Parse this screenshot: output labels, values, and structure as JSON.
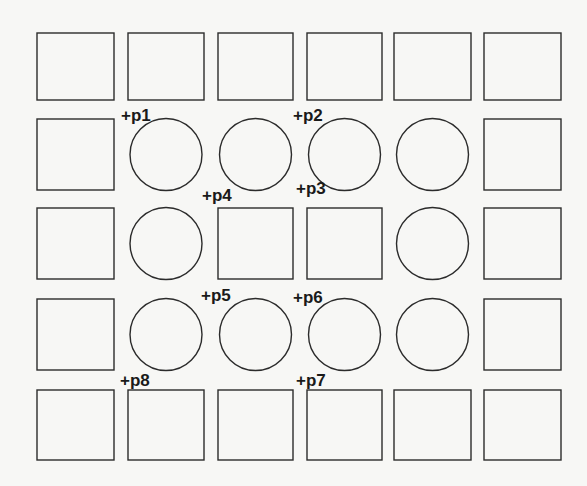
{
  "diagram": {
    "type": "grid-layout",
    "rows": 5,
    "cols": 6,
    "stroke_color": "#2b2b2b",
    "background": "#f7f7f5",
    "col_x": [
      [
        37,
        114
      ],
      [
        128,
        204
      ],
      [
        218,
        293
      ],
      [
        307,
        382
      ],
      [
        394,
        471
      ],
      [
        484,
        561
      ]
    ],
    "row_y": [
      [
        33,
        100
      ],
      [
        119,
        190
      ],
      [
        208,
        279
      ],
      [
        299,
        370
      ],
      [
        390,
        460
      ]
    ],
    "cells": [
      [
        "square",
        "square",
        "square",
        "square",
        "square",
        "square"
      ],
      [
        "square",
        "circle",
        "circle",
        "circle",
        "circle",
        "square"
      ],
      [
        "square",
        "circle",
        "square",
        "square",
        "circle",
        "square"
      ],
      [
        "square",
        "circle",
        "circle",
        "circle",
        "circle",
        "square"
      ],
      [
        "square",
        "square",
        "square",
        "square",
        "square",
        "square"
      ]
    ],
    "points": [
      {
        "label": "+p1",
        "x": 121,
        "y": 121
      },
      {
        "label": "+p2",
        "x": 293,
        "y": 121
      },
      {
        "label": "+p3",
        "x": 296,
        "y": 194
      },
      {
        "label": "+p4",
        "x": 202,
        "y": 201
      },
      {
        "label": "+p5",
        "x": 201,
        "y": 301
      },
      {
        "label": "+p6",
        "x": 293,
        "y": 303
      },
      {
        "label": "+p7",
        "x": 296,
        "y": 386
      },
      {
        "label": "+p8",
        "x": 120,
        "y": 386
      }
    ]
  }
}
